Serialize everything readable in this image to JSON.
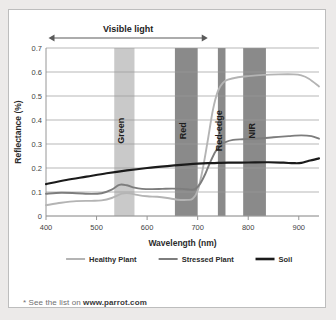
{
  "footnote": {
    "prefix": "* See the list on ",
    "link": "www.parrot.com"
  },
  "annotations": {
    "visible_light": "Visible light"
  },
  "colors": {
    "healthy": "#b4b4b4",
    "stressed": "#7d7d7d",
    "soil": "#1b1b1b",
    "band_light": "#c9c9c9",
    "band_dark": "#8a8a8a",
    "grid": "#9a9a9a",
    "card_bg": "#ffffff",
    "page_bg": "#eceae9"
  },
  "chart_data": {
    "type": "line",
    "title": "",
    "xlabel": "Wavelength (nm)",
    "ylabel": "Reflectance (%)",
    "xlim": [
      400,
      940
    ],
    "ylim": [
      0,
      0.7
    ],
    "xticks": [
      400,
      500,
      600,
      700,
      800,
      900
    ],
    "yticks": [
      0,
      0.1,
      0.2,
      0.3,
      0.4,
      0.5,
      0.6,
      0.7
    ],
    "grid": true,
    "legend_position": "bottom",
    "legend": [
      "Healthy Plant",
      "Stressed Plant",
      "Soil"
    ],
    "bands": [
      {
        "name": "Green",
        "range": [
          535,
          575
        ],
        "shade": "light"
      },
      {
        "name": "Red",
        "range": [
          655,
          700
        ],
        "shade": "dark"
      },
      {
        "name": "Red-edge",
        "range": [
          740,
          755
        ],
        "shade": "dark"
      },
      {
        "name": "NIR",
        "range": [
          790,
          835
        ],
        "shade": "dark"
      }
    ],
    "visible_light_range": [
      405,
      720
    ],
    "series": [
      {
        "name": "Healthy Plant",
        "color": "#b4b4b4",
        "x": [
          400,
          430,
          460,
          490,
          510,
          530,
          550,
          565,
          580,
          600,
          620,
          640,
          660,
          680,
          690,
          700,
          710,
          720,
          730,
          740,
          750,
          760,
          780,
          800,
          830,
          860,
          890,
          905,
          920,
          940
        ],
        "y": [
          0.045,
          0.055,
          0.062,
          0.063,
          0.065,
          0.075,
          0.093,
          0.095,
          0.088,
          0.082,
          0.08,
          0.075,
          0.068,
          0.067,
          0.072,
          0.105,
          0.195,
          0.315,
          0.44,
          0.52,
          0.555,
          0.568,
          0.578,
          0.583,
          0.588,
          0.59,
          0.59,
          0.586,
          0.572,
          0.54
        ]
      },
      {
        "name": "Stressed Plant",
        "color": "#7d7d7d",
        "x": [
          400,
          430,
          460,
          490,
          510,
          530,
          545,
          560,
          575,
          590,
          610,
          630,
          650,
          670,
          685,
          695,
          705,
          715,
          725,
          735,
          745,
          755,
          770,
          790,
          820,
          850,
          880,
          905,
          925,
          940
        ],
        "y": [
          0.093,
          0.097,
          0.095,
          0.092,
          0.095,
          0.11,
          0.13,
          0.128,
          0.118,
          0.113,
          0.112,
          0.113,
          0.114,
          0.113,
          0.11,
          0.112,
          0.135,
          0.175,
          0.225,
          0.268,
          0.295,
          0.308,
          0.317,
          0.32,
          0.323,
          0.328,
          0.333,
          0.336,
          0.333,
          0.322
        ]
      },
      {
        "name": "Soil",
        "color": "#1b1b1b",
        "x": [
          400,
          440,
          480,
          520,
          560,
          600,
          640,
          680,
          700,
          720,
          740,
          760,
          800,
          840,
          870,
          890,
          905,
          920,
          940
        ],
        "y": [
          0.133,
          0.15,
          0.164,
          0.178,
          0.19,
          0.2,
          0.208,
          0.215,
          0.218,
          0.22,
          0.221,
          0.222,
          0.223,
          0.224,
          0.222,
          0.22,
          0.221,
          0.23,
          0.24
        ]
      }
    ]
  }
}
